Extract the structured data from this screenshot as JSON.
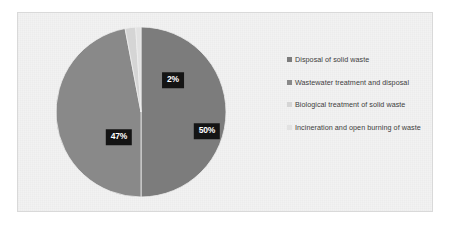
{
  "chart_data": {
    "type": "pie",
    "title": "",
    "categories": [
      "Disposal of solid waste",
      "Wastewater treatment and disposal",
      "Biological treatment of solid waste",
      "Incineration and open burning of waste"
    ],
    "values": [
      50,
      47,
      2,
      1
    ],
    "value_labels": [
      "50%",
      "47%",
      "2%",
      ""
    ],
    "colors": [
      "#7c7c7c",
      "#898989",
      "#d5d5d5",
      "#e2e2e2"
    ],
    "legend_position": "right",
    "grid": false,
    "xlabel": "",
    "ylabel": "",
    "start_angle_deg": 0,
    "units": "percent"
  },
  "legend": {
    "items": [
      {
        "label": "Disposal of solid waste",
        "color": "#7c7c7c"
      },
      {
        "label": "Wastewater treatment and disposal",
        "color": "#898989"
      },
      {
        "label": "Biological treatment of solid waste",
        "color": "#d5d5d5"
      },
      {
        "label": "Incineration and open burning of waste",
        "color": "#e2e2e2"
      }
    ]
  },
  "frame": {
    "background": "#f2f2f2",
    "border_color": "#d9d9d9"
  }
}
